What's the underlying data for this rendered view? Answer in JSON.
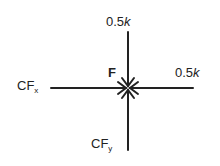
{
  "diagram": {
    "node": {
      "label": "F"
    },
    "forces": [
      {
        "id": "top",
        "value": "0.5",
        "unit": "k",
        "direction": "down, toward F"
      },
      {
        "id": "right",
        "value": "0.5",
        "unit": "k",
        "direction": "left, toward F"
      },
      {
        "id": "left",
        "base": "CF",
        "sub": "x",
        "direction": "right, toward F"
      },
      {
        "id": "bottom",
        "base": "CF",
        "sub": "y",
        "direction": "up, toward F"
      }
    ]
  }
}
